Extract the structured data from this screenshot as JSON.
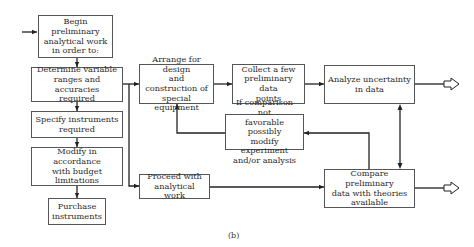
{
  "diagram": {
    "caption": "(b)",
    "boxes": {
      "begin": "Begin preliminary\nanalytical work\nin order to:",
      "determine": "Determine variable\nranges and accuracies\nrequired",
      "specify": "Specify instruments\nrequired",
      "modify_budget": "Modify in accordance\nwith budget\nlimitations",
      "purchase": "Purchase\ninstruments",
      "arrange": "Arrange for design\nand construction of\nspecial equipment",
      "collect": "Collect a few\npreliminary data\npoints",
      "analyze": "Analyze uncertainty\nin data",
      "if_comparison": "If comparison not\nfavorable possibly\nmodify experiment\nand/or analysis",
      "proceed": "Proceed with\nanalytical work",
      "compare": "Compare preliminary\ndata with theories\navailable"
    },
    "edges": [
      {
        "from": "entry",
        "to": "begin"
      },
      {
        "from": "begin",
        "to": "determine"
      },
      {
        "from": "determine",
        "to": "specify"
      },
      {
        "from": "specify",
        "to": "modify_budget"
      },
      {
        "from": "modify_budget",
        "to": "purchase"
      },
      {
        "from": "determine",
        "to": "arrange"
      },
      {
        "from": "determine",
        "to": "proceed"
      },
      {
        "from": "arrange",
        "to": "collect"
      },
      {
        "from": "collect",
        "to": "analyze"
      },
      {
        "from": "analyze",
        "to": "exit-1"
      },
      {
        "from": "analyze",
        "to": "compare",
        "bidirectional": true
      },
      {
        "from": "compare",
        "to": "if_comparison"
      },
      {
        "from": "if_comparison",
        "to": "arrange"
      },
      {
        "from": "proceed",
        "to": "compare"
      },
      {
        "from": "compare",
        "to": "exit-2"
      }
    ]
  }
}
